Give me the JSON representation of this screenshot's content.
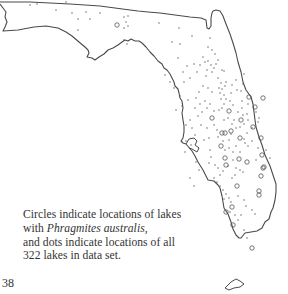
{
  "figure": {
    "type": "lake-location-map",
    "region": "Florida",
    "legend": {
      "circle_meaning": "lakes with Phragmites australis",
      "dot_meaning": "locations of all lakes in data set",
      "total_lakes": 322
    }
  },
  "caption": {
    "line1": "Circles indicate locations of lakes",
    "line2_prefix": "with ",
    "line2_species": "Phragmites australis,",
    "line3": "and dots indicate locations of all",
    "line4": "322 lakes in data set."
  },
  "page": {
    "number": "38"
  },
  "colors": {
    "outline": "#4a4a4a",
    "marker": "#555555",
    "text": "#333333",
    "background": "#ffffff"
  },
  "markers": {
    "circles": [
      [
        117,
        25
      ],
      [
        241,
        120
      ],
      [
        253,
        127
      ],
      [
        255,
        107
      ],
      [
        249,
        97
      ],
      [
        263,
        98
      ],
      [
        231,
        131
      ],
      [
        240,
        138
      ],
      [
        261,
        138
      ],
      [
        262,
        155
      ],
      [
        264,
        167
      ],
      [
        232,
        207
      ],
      [
        226,
        212
      ],
      [
        225,
        158
      ],
      [
        239,
        159
      ],
      [
        222,
        133
      ],
      [
        229,
        111
      ],
      [
        212,
        118
      ],
      [
        221,
        146
      ],
      [
        247,
        162
      ],
      [
        261,
        176
      ],
      [
        226,
        165
      ],
      [
        259,
        191
      ],
      [
        259,
        195
      ],
      [
        263,
        168
      ],
      [
        237,
        186
      ],
      [
        225,
        133
      ],
      [
        233,
        225
      ],
      [
        252,
        248
      ]
    ],
    "dots": [
      [
        30,
        5
      ],
      [
        37,
        4
      ],
      [
        66,
        2
      ],
      [
        56,
        10
      ],
      [
        72,
        13
      ],
      [
        86,
        12
      ],
      [
        78,
        19
      ],
      [
        90,
        19
      ],
      [
        100,
        13
      ],
      [
        78,
        30
      ],
      [
        124,
        17
      ],
      [
        126,
        22
      ],
      [
        128,
        26
      ],
      [
        124,
        28
      ],
      [
        128,
        16
      ],
      [
        124,
        40
      ],
      [
        127,
        44
      ],
      [
        159,
        23
      ],
      [
        179,
        28
      ],
      [
        192,
        36
      ],
      [
        172,
        42
      ],
      [
        180,
        44
      ],
      [
        178,
        58
      ],
      [
        210,
        38
      ],
      [
        208,
        47
      ],
      [
        212,
        50
      ],
      [
        203,
        57
      ],
      [
        215,
        54
      ],
      [
        208,
        61
      ],
      [
        211,
        65
      ],
      [
        214,
        68
      ],
      [
        205,
        62
      ],
      [
        200,
        65
      ],
      [
        218,
        60
      ],
      [
        216,
        64
      ],
      [
        222,
        70
      ],
      [
        207,
        70
      ],
      [
        212,
        72
      ],
      [
        224,
        71
      ],
      [
        206,
        76
      ],
      [
        218,
        78
      ],
      [
        221,
        83
      ],
      [
        225,
        86
      ],
      [
        219,
        88
      ],
      [
        226,
        82
      ],
      [
        222,
        89
      ],
      [
        224,
        95
      ],
      [
        226,
        99
      ],
      [
        220,
        93
      ],
      [
        231,
        93
      ],
      [
        237,
        90
      ],
      [
        232,
        85
      ],
      [
        243,
        84
      ],
      [
        236,
        80
      ],
      [
        244,
        74
      ],
      [
        241,
        91
      ],
      [
        224,
        104
      ],
      [
        221,
        99
      ],
      [
        222,
        108
      ],
      [
        230,
        101
      ],
      [
        233,
        105
      ],
      [
        238,
        112
      ],
      [
        243,
        115
      ],
      [
        247,
        114
      ],
      [
        242,
        101
      ],
      [
        234,
        120
      ],
      [
        236,
        128
      ],
      [
        228,
        118
      ],
      [
        232,
        124
      ],
      [
        224,
        120
      ],
      [
        219,
        110
      ],
      [
        214,
        111
      ],
      [
        205,
        101
      ],
      [
        210,
        104
      ],
      [
        207,
        108
      ],
      [
        202,
        112
      ],
      [
        198,
        116
      ],
      [
        201,
        125
      ],
      [
        207,
        128
      ],
      [
        209,
        138
      ],
      [
        204,
        140
      ],
      [
        210,
        150
      ],
      [
        211,
        157
      ],
      [
        209,
        163
      ],
      [
        215,
        165
      ],
      [
        218,
        168
      ],
      [
        223,
        171
      ],
      [
        220,
        175
      ],
      [
        214,
        178
      ],
      [
        217,
        182
      ],
      [
        220,
        186
      ],
      [
        223,
        190
      ],
      [
        226,
        194
      ],
      [
        229,
        198
      ],
      [
        231,
        202
      ],
      [
        224,
        199
      ],
      [
        232,
        178
      ],
      [
        235,
        175
      ],
      [
        240,
        170
      ],
      [
        243,
        172
      ],
      [
        245,
        143
      ],
      [
        248,
        146
      ],
      [
        252,
        141
      ],
      [
        244,
        139
      ],
      [
        247,
        133
      ],
      [
        252,
        128
      ],
      [
        240,
        127
      ],
      [
        244,
        124
      ],
      [
        248,
        120
      ],
      [
        256,
        112
      ],
      [
        259,
        118
      ],
      [
        242,
        108
      ],
      [
        248,
        104
      ],
      [
        258,
        122
      ],
      [
        190,
        120
      ],
      [
        186,
        125
      ],
      [
        192,
        128
      ],
      [
        195,
        135
      ],
      [
        186,
        141
      ],
      [
        191,
        145
      ],
      [
        185,
        152
      ],
      [
        196,
        162
      ],
      [
        199,
        170
      ],
      [
        190,
        178
      ],
      [
        194,
        186
      ],
      [
        230,
        212
      ],
      [
        235,
        215
      ],
      [
        238,
        220
      ],
      [
        241,
        215
      ],
      [
        244,
        230
      ],
      [
        247,
        238
      ],
      [
        256,
        160
      ],
      [
        266,
        150
      ],
      [
        270,
        158
      ],
      [
        258,
        148
      ],
      [
        229,
        148
      ],
      [
        233,
        152
      ],
      [
        236,
        146
      ],
      [
        240,
        152
      ],
      [
        233,
        160
      ],
      [
        228,
        166
      ],
      [
        236,
        168
      ],
      [
        238,
        196
      ],
      [
        244,
        200
      ],
      [
        246,
        206
      ],
      [
        252,
        210
      ],
      [
        255,
        214
      ],
      [
        214,
        125
      ],
      [
        217,
        130
      ],
      [
        218,
        137
      ],
      [
        223,
        141
      ],
      [
        225,
        150
      ],
      [
        229,
        140
      ],
      [
        231,
        134
      ],
      [
        212,
        92
      ],
      [
        208,
        88
      ],
      [
        203,
        86
      ],
      [
        199,
        92
      ],
      [
        196,
        98
      ],
      [
        200,
        104
      ],
      [
        195,
        108
      ],
      [
        188,
        100
      ],
      [
        182,
        106
      ],
      [
        176,
        110
      ],
      [
        180,
        96
      ],
      [
        174,
        88
      ],
      [
        170,
        82
      ],
      [
        165,
        75
      ],
      [
        184,
        82
      ],
      [
        190,
        78
      ],
      [
        197,
        72
      ],
      [
        194,
        64
      ],
      [
        187,
        66
      ],
      [
        183,
        72
      ]
    ]
  }
}
